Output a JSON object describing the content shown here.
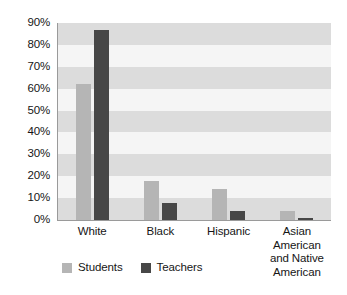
{
  "chart_data": {
    "type": "bar",
    "title": "",
    "subtitle": "",
    "xlabel": "",
    "ylabel": "",
    "categories": [
      "White",
      "Black",
      "Hispanic",
      "Asian American and Native American"
    ],
    "category_lines": [
      [
        "White"
      ],
      [
        "Black"
      ],
      [
        "Hispanic"
      ],
      [
        "Asian",
        "American",
        "and Native",
        "American"
      ]
    ],
    "series": [
      {
        "name": "Students",
        "color": "#b5b5b5",
        "values": [
          62,
          18,
          14,
          4
        ]
      },
      {
        "name": "Teachers",
        "color": "#474747",
        "values": [
          87,
          8,
          4,
          1
        ]
      }
    ],
    "ylim": [
      0,
      90
    ],
    "ytick_step": 10,
    "ytick_labels": [
      "90%",
      "80%",
      "70%",
      "60%",
      "50%",
      "40%",
      "30%",
      "20%",
      "10%",
      "0%"
    ],
    "ytick_values": [
      90,
      80,
      70,
      60,
      50,
      40,
      30,
      20,
      10,
      0
    ],
    "grid": "horizontal-alternating-bands",
    "legend_position": "bottom-left",
    "value_suffix": "%"
  },
  "legend": {
    "items": [
      {
        "label": "Students",
        "color": "#b5b5b5"
      },
      {
        "label": "Teachers",
        "color": "#474747"
      }
    ]
  }
}
